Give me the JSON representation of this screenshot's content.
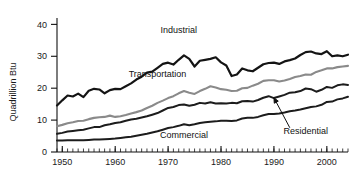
{
  "chart_data": {
    "type": "line",
    "title": "",
    "xlabel": "",
    "ylabel": "Quadrillion Btu",
    "xlim": [
      1949,
      2004
    ],
    "ylim": [
      0,
      42
    ],
    "grid": false,
    "legend_position": "inline-labels",
    "y_ticks": [
      0,
      10,
      20,
      30,
      40
    ],
    "y_tick_labels": [
      "0",
      "10",
      "20",
      "30",
      "40"
    ],
    "x_ticks": [
      1950,
      1960,
      1970,
      1980,
      1990,
      2000
    ],
    "x_tick_labels": [
      "1950",
      "1960",
      "1970",
      "1980",
      "1990",
      "2000"
    ],
    "x_minor_tick_step": 1,
    "x": [
      1949,
      1950,
      1951,
      1952,
      1953,
      1954,
      1955,
      1956,
      1957,
      1958,
      1959,
      1960,
      1961,
      1962,
      1963,
      1964,
      1965,
      1966,
      1967,
      1968,
      1969,
      1970,
      1971,
      1972,
      1973,
      1974,
      1975,
      1976,
      1977,
      1978,
      1979,
      1980,
      1981,
      1982,
      1983,
      1984,
      1985,
      1986,
      1987,
      1988,
      1989,
      1990,
      1991,
      1992,
      1993,
      1994,
      1995,
      1996,
      1997,
      1998,
      1999,
      2000,
      2001,
      2002,
      2003,
      2004
    ],
    "series": [
      {
        "name": "Industrial",
        "color": "#141414",
        "width": 2.2,
        "label_x": 1972,
        "label_y": 37.2,
        "values": [
          14.6,
          16.2,
          17.7,
          17.4,
          18.3,
          17.2,
          19.2,
          19.8,
          19.6,
          18.4,
          19.4,
          19.8,
          19.7,
          20.6,
          21.5,
          22.7,
          23.6,
          24.9,
          25.2,
          26.4,
          27.6,
          28.0,
          27.4,
          28.9,
          30.3,
          29.2,
          26.8,
          28.6,
          28.9,
          29.2,
          29.7,
          28.1,
          27.1,
          23.8,
          24.3,
          26.2,
          25.6,
          25.3,
          26.4,
          27.5,
          27.9,
          28.0,
          27.6,
          28.4,
          28.8,
          29.3,
          30.4,
          31.3,
          31.5,
          30.9,
          30.7,
          31.6,
          30.0,
          30.3,
          30.0,
          30.5
        ]
      },
      {
        "name": "Transportation",
        "color": "#8a8a8a",
        "width": 2.1,
        "label_x": 1968,
        "label_y": 23.4,
        "values": [
          8.1,
          8.5,
          9.0,
          9.3,
          9.7,
          9.8,
          10.3,
          10.7,
          10.9,
          11.0,
          11.4,
          11.0,
          11.2,
          11.6,
          12.1,
          12.5,
          13.0,
          13.8,
          14.5,
          15.4,
          16.1,
          16.9,
          17.5,
          18.4,
          19.1,
          18.6,
          18.2,
          19.1,
          19.8,
          20.6,
          20.2,
          19.7,
          19.5,
          19.1,
          19.2,
          20.0,
          20.1,
          20.8,
          21.4,
          22.3,
          22.5,
          22.5,
          22.1,
          22.4,
          22.9,
          23.5,
          23.8,
          24.3,
          24.2,
          25.1,
          25.6,
          26.2,
          26.2,
          26.6,
          26.8,
          27.0
        ]
      },
      {
        "name": "Residential",
        "color": "#1c1c1c",
        "width": 2.0,
        "label_x": 1996,
        "label_y": 5.6,
        "arrow_from_x": 1993,
        "arrow_from_y": 7.6,
        "arrow_to_x": 1990,
        "arrow_to_y": 17.0,
        "values": [
          5.7,
          6.0,
          6.4,
          6.6,
          6.8,
          7.0,
          7.4,
          7.8,
          7.8,
          8.4,
          8.7,
          9.1,
          9.3,
          9.8,
          10.2,
          10.4,
          10.8,
          11.2,
          11.7,
          12.2,
          13.0,
          13.8,
          14.1,
          14.7,
          14.9,
          14.5,
          14.8,
          15.4,
          15.2,
          15.6,
          15.2,
          15.3,
          15.2,
          15.4,
          15.3,
          15.9,
          16.0,
          15.8,
          16.3,
          17.0,
          17.5,
          16.9,
          17.4,
          17.9,
          18.6,
          18.7,
          19.1,
          19.9,
          19.7,
          18.9,
          19.5,
          20.4,
          20.1,
          20.9,
          21.2,
          21.0
        ]
      },
      {
        "name": "Commercial",
        "color": "#1c1c1c",
        "width": 2.0,
        "label_x": 1973,
        "label_y": 4.4,
        "values": [
          3.6,
          3.6,
          3.7,
          3.7,
          3.7,
          3.7,
          3.8,
          3.9,
          3.9,
          4.0,
          4.1,
          4.2,
          4.4,
          4.6,
          4.8,
          5.1,
          5.4,
          5.7,
          6.1,
          6.5,
          7.0,
          7.5,
          7.8,
          8.2,
          8.7,
          8.4,
          8.7,
          9.1,
          9.3,
          9.5,
          9.6,
          9.8,
          9.8,
          9.7,
          9.9,
          10.5,
          10.7,
          10.7,
          11.0,
          11.5,
          11.9,
          11.9,
          12.1,
          12.4,
          12.8,
          13.0,
          13.3,
          13.7,
          14.1,
          14.3,
          14.8,
          15.7,
          15.8,
          16.5,
          16.8,
          17.3
        ]
      }
    ]
  }
}
